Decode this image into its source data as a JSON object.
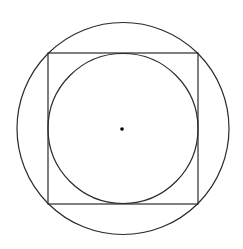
{
  "diagram": {
    "width": 243,
    "height": 249,
    "background": "#ffffff",
    "stroke_color": "#2a2a2a",
    "stroke_width": 1.2,
    "outer_circle": {
      "cx": 123,
      "cy": 128.5,
      "r": 106
    },
    "square": {
      "x": 48,
      "y": 53,
      "width": 150,
      "height": 151
    },
    "inner_circle": {
      "cx": 123,
      "cy": 128.5,
      "r": 75
    },
    "center_point": {
      "cx": 122,
      "cy": 129,
      "r": 1.8,
      "fill": "#000000"
    }
  }
}
